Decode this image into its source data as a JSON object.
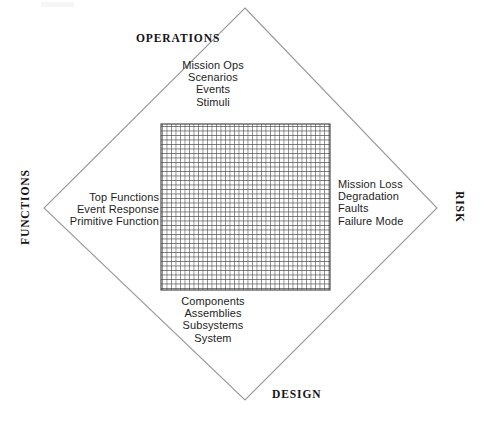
{
  "diagram": {
    "shape": "diamond",
    "axis_labels": {
      "top": "OPERATIONS",
      "right": "RISK",
      "bottom": "DESIGN",
      "left": "FUNCTIONS"
    },
    "quadrants": {
      "top": {
        "name": "operations-items",
        "items": [
          "Mission Ops",
          "Scenarios",
          "Events",
          "Stimuli"
        ]
      },
      "right": {
        "name": "risk-items",
        "items": [
          "Mission Loss",
          "Degradation",
          "Faults",
          "Failure Mode"
        ]
      },
      "bottom": {
        "name": "design-items",
        "items": [
          "Components",
          "Assemblies",
          "Subsystems",
          "System"
        ]
      },
      "left": {
        "name": "functions-items",
        "items": [
          "Top Functions",
          "Event Response",
          "Primitive Function"
        ]
      }
    },
    "grid": {
      "name": "center-mesh-grid",
      "x": 161,
      "y": 124,
      "width": 169,
      "height": 166,
      "cell_size": 4.5,
      "line_color": "#4a4a4a"
    },
    "vertices": {
      "top": [
        245,
        8
      ],
      "right": [
        437,
        208
      ],
      "bottom": [
        245,
        400
      ],
      "left": [
        44,
        208
      ]
    },
    "colors": {
      "outline": "#9a9a9a",
      "text": "#1d1d1d",
      "label": "#141414",
      "background": "#ffffff"
    }
  }
}
